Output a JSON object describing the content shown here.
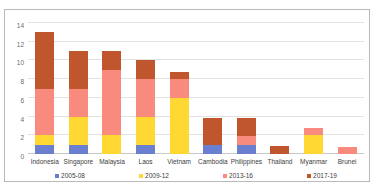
{
  "chart_data": {
    "type": "bar",
    "stacked": true,
    "title": "",
    "subtitle": "",
    "xlabel": "",
    "ylabel": "",
    "ylim": [
      0,
      14
    ],
    "yticks": [
      0,
      2,
      4,
      6,
      8,
      10,
      12,
      14
    ],
    "ytick_labels": [
      "0",
      "2",
      "4",
      "6",
      "8",
      "10",
      "12",
      "14"
    ],
    "grid": true,
    "legend_position": "bottom",
    "categories": [
      "Indonesia",
      "Singapore",
      "Malaysia",
      "Laos",
      "Vietnam",
      "Cambodia",
      "Philippines",
      "Thailand",
      "Myanmar",
      "Brunei"
    ],
    "series": [
      {
        "name": "2005-08",
        "color": "#6B7FD0",
        "values": [
          1,
          1,
          0,
          1,
          0,
          1,
          1,
          0,
          0,
          0
        ]
      },
      {
        "name": "2009-12",
        "color": "#FFD833",
        "values": [
          1,
          3,
          2,
          3,
          6,
          0,
          0,
          0,
          2,
          0
        ]
      },
      {
        "name": "2013-16",
        "color": "#F98B7E",
        "values": [
          5,
          3,
          7,
          4,
          2,
          0,
          0.9,
          0,
          0.8,
          0.8
        ]
      },
      {
        "name": "2017-19",
        "color": "#C0562E",
        "values": [
          6,
          4,
          2,
          2,
          0.8,
          2.9,
          2,
          0.85,
          0,
          0
        ]
      }
    ],
    "totals": [
      13,
      11.9,
      11,
      10,
      8.8,
      3.9,
      3.9,
      0.85,
      2.8,
      0.8
    ]
  }
}
